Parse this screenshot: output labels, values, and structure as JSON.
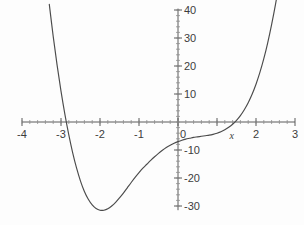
{
  "figure": {
    "background_color": "#fdfdfd",
    "curve_color": "#4b4b4b",
    "axis_color": "#5a5a5a",
    "label_color": "#3c3c3c"
  },
  "axes": {
    "x_axis_name": "x",
    "y_axis_name": "",
    "x_ticks": [
      {
        "value": -4,
        "label": "-4"
      },
      {
        "value": -3,
        "label": "-3"
      },
      {
        "value": -2,
        "label": "-2"
      },
      {
        "value": -1,
        "label": "-1"
      },
      {
        "value": 0,
        "label": "0"
      },
      {
        "value": 1,
        "label": ""
      },
      {
        "value": 2,
        "label": "2"
      },
      {
        "value": 3,
        "label": "3"
      }
    ],
    "y_ticks": [
      {
        "value": 40,
        "label": "40"
      },
      {
        "value": 30,
        "label": "30"
      },
      {
        "value": 20,
        "label": "20"
      },
      {
        "value": 10,
        "label": "10"
      },
      {
        "value": -10,
        "label": "-10"
      },
      {
        "value": -20,
        "label": "-20"
      },
      {
        "value": -30,
        "label": "-30"
      }
    ]
  },
  "chart_data": {
    "type": "line",
    "title": "",
    "subtitle": "",
    "xlabel": "x",
    "ylabel": "",
    "xlim": [
      -4,
      3
    ],
    "ylim": [
      -33,
      42
    ],
    "grid": false,
    "legend": null,
    "legend_position": "none",
    "x_tick_labels": [
      "-4",
      "-3",
      "-2",
      "-1",
      "0",
      "",
      "2",
      "3"
    ],
    "y_tick_labels": [
      "40",
      "30",
      "20",
      "10",
      "-10",
      "-20",
      "-30"
    ],
    "annotations": [],
    "series": [
      {
        "name": "quartic",
        "description": "Quartic curve with x-intercepts near -3 and 1.75, local minimum near (-1.95, -28), y-intercept near -7",
        "roots": [
          -3,
          1.75
        ],
        "minimum": {
          "x": -1.95,
          "y": -28
        },
        "y_intercept": -7,
        "x": [
          -3.3,
          -3.2,
          -3.1,
          -3.0,
          -2.9,
          -2.8,
          -2.7,
          -2.6,
          -2.5,
          -2.4,
          -2.3,
          -2.2,
          -2.1,
          -2.0,
          -1.9,
          -1.8,
          -1.7,
          -1.6,
          -1.5,
          -1.4,
          -1.3,
          -1.2,
          -1.1,
          -1.0,
          -0.9,
          -0.8,
          -0.7,
          -0.6,
          -0.5,
          -0.4,
          -0.3,
          -0.2,
          -0.1,
          0.0,
          0.1,
          0.2,
          0.3,
          0.4,
          0.5,
          0.6,
          0.7,
          0.8,
          0.9,
          1.0,
          1.1,
          1.2,
          1.3,
          1.4,
          1.5,
          1.6,
          1.7,
          1.8,
          1.9,
          2.0,
          2.1,
          2.2,
          2.3,
          2.4,
          2.5,
          2.6,
          2.7,
          2.8,
          2.9,
          3.0
        ],
        "y": [
          42.0,
          30.6,
          20.3,
          11.0,
          2.7,
          -4.6,
          -11.0,
          -16.5,
          -21.1,
          -24.8,
          -27.6,
          -29.6,
          -30.9,
          -31.5,
          -31.5,
          -31.0,
          -30.0,
          -28.7,
          -27.1,
          -25.4,
          -23.5,
          -21.6,
          -19.8,
          -18.1,
          -16.5,
          -15.1,
          -13.7,
          -12.4,
          -11.2,
          -10.1,
          -9.1,
          -8.3,
          -7.6,
          -7.0,
          -6.5,
          -6.1,
          -5.8,
          -5.5,
          -5.3,
          -5.1,
          -4.9,
          -4.7,
          -4.4,
          -4.0,
          -3.5,
          -2.8,
          -1.9,
          -0.8,
          0.6,
          2.3,
          4.4,
          6.9,
          9.9,
          13.5,
          17.7,
          22.6,
          28.3,
          34.8,
          42.0,
          50.2,
          59.4,
          69.7,
          81.1,
          93.7
        ]
      }
    ]
  }
}
